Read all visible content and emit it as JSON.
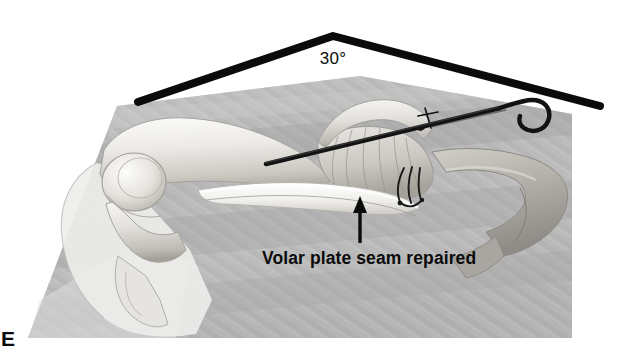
{
  "figure": {
    "panel_letter": "E",
    "domain_type": "medical-surgical-illustration",
    "background_color": "#ffffff",
    "illustration_panel_color": "#b9b9b9",
    "ink_color": "#0b0b0b",
    "bone_light_color": "#f2f1ef",
    "bone_mid_color": "#cfcdc8",
    "bone_shadow_color": "#9e9c97"
  },
  "annotations": {
    "angle": {
      "label": "30°",
      "value": 30,
      "unit": "degrees",
      "description": "flexion angle marker drawn as a thick chevron over the finger"
    },
    "callout": {
      "label": "Volar plate seam repaired",
      "arrow": "up-arrow",
      "arrow_direction": "up",
      "points_to": "volar-plate-seam"
    }
  },
  "hardware": {
    "kwire": {
      "name": "extension-block K-wire",
      "end_shape": "hook",
      "color": "#121212"
    },
    "sutures": {
      "name": "volar plate repair sutures",
      "knot_label": "suture-knot",
      "loop_count": 3,
      "color": "#1a1a1a"
    }
  },
  "anatomy": {
    "structures": [
      "proximal phalanx",
      "middle phalanx",
      "distal phalanx",
      "PIP joint condyle",
      "volar plate",
      "collateral ligament fan",
      "flexor tendon sheath"
    ]
  }
}
